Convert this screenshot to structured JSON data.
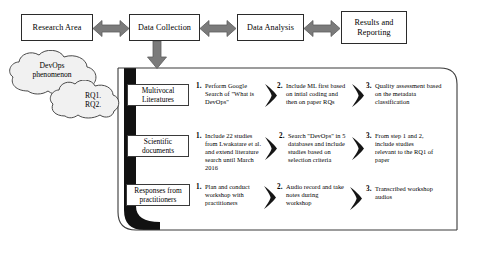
{
  "diagram": {
    "colors": {
      "arrow_gray": "#7f7f7f",
      "arrow_gray_dark": "#6b6b6b",
      "container_black": "#111111",
      "box_border": "#2b2b2b",
      "cloud_fill": "#f2f2f2",
      "cloud_stroke": "#555555",
      "chevron_black": "#161616"
    },
    "process_boxes": [
      {
        "id": "research-area",
        "label": "Research Area"
      },
      {
        "id": "data-collection",
        "label": "Data Collection"
      },
      {
        "id": "data-analysis",
        "label": "Data Analysis"
      },
      {
        "id": "results-reporting",
        "label": "Results and Reporting"
      }
    ],
    "connectors": [
      {
        "id": "arrow-research-to-collection",
        "icon": "double-headed-arrow-icon"
      },
      {
        "id": "arrow-collection-to-analysis",
        "icon": "double-headed-arrow-icon"
      },
      {
        "id": "arrow-analysis-to-results",
        "icon": "double-headed-arrow-icon"
      },
      {
        "id": "arrow-collection-to-detail",
        "icon": "down-arrow-icon"
      }
    ],
    "clouds": [
      {
        "id": "devops-phenomenon",
        "line1": "DevOps",
        "line2": "phenomenon"
      },
      {
        "id": "research-questions",
        "line1": "RQ1.",
        "line2": "RQ2."
      }
    ],
    "rows": [
      {
        "source_label": "Multivocal Literatures",
        "steps": [
          {
            "num": "1.",
            "text": "Perform Google Search of \"What is DevOps\""
          },
          {
            "num": "2.",
            "text": "Include ML first based on intial coding and then on paper RQs"
          },
          {
            "num": "3.",
            "text": "Quality assessment based on the metadata classification"
          }
        ]
      },
      {
        "source_label": "Scientific documents",
        "steps": [
          {
            "num": "1.",
            "text": "Include 22 studies from Lwakatare et al. and extend literature search until March 2016"
          },
          {
            "num": "2.",
            "text": "Search \"DevOps\" in 5 databases and include studies based on selection criteria"
          },
          {
            "num": "3.",
            "text": "From step 1 and 2, include studies relevant to the RQ1 of paper"
          }
        ]
      },
      {
        "source_label": "Responses from practitioners",
        "steps": [
          {
            "num": "1.",
            "text": "Plan and conduct workshop with practitioners"
          },
          {
            "num": "2.",
            "text": "Audio record and take notes during workshop"
          },
          {
            "num": "3.",
            "text": "Transcribed workshop audios"
          }
        ]
      }
    ]
  }
}
